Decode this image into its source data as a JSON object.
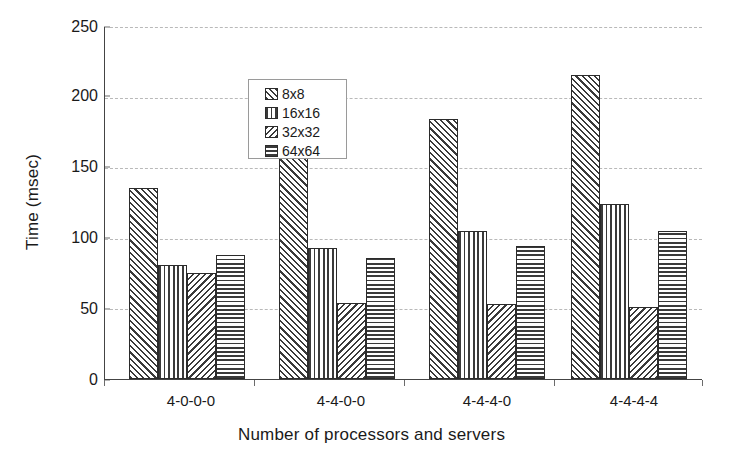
{
  "chart_data": {
    "type": "bar",
    "title": "",
    "xlabel": "Number of processors and servers",
    "ylabel": "Time (msec)",
    "categories": [
      "4-0-0-0",
      "4-4-0-0",
      "4-4-4-0",
      "4-4-4-4"
    ],
    "series": [
      {
        "name": "8x8",
        "pattern": "forward-diagonal-hatch",
        "values": [
          135,
          165,
          184,
          215
        ]
      },
      {
        "name": "16x16",
        "pattern": "vertical-lines",
        "values": [
          81,
          93,
          105,
          124
        ]
      },
      {
        "name": "32x32",
        "pattern": "backward-diagonal-hatch",
        "values": [
          75,
          54,
          53,
          51
        ]
      },
      {
        "name": "64x64",
        "pattern": "horizontal-lines",
        "values": [
          88,
          86,
          94,
          105
        ]
      }
    ],
    "ylim": [
      0,
      250
    ],
    "yticks": [
      0,
      50,
      100,
      150,
      200,
      250
    ],
    "ytick_labels": [
      "0",
      "50",
      "100",
      "150",
      "200",
      "250"
    ],
    "grid": true,
    "grid_axis": "y",
    "grid_style": "dashed",
    "legend_position": "upper-left-inside",
    "colors": {
      "hatch": "#3a3a3a",
      "bar_outline": "#2b2b2b",
      "gridline": "#b9b9b9",
      "axis": "#444444",
      "background": "#ffffff",
      "text": "#1a1a1a"
    }
  },
  "legend": {
    "items": [
      {
        "label": "8x8",
        "swatch": "forward-diagonal-hatch-swatch"
      },
      {
        "label": "16x16",
        "swatch": "vertical-lines-swatch"
      },
      {
        "label": "32x32",
        "swatch": "backward-diagonal-hatch-swatch"
      },
      {
        "label": "64x64",
        "swatch": "horizontal-lines-swatch"
      }
    ]
  }
}
